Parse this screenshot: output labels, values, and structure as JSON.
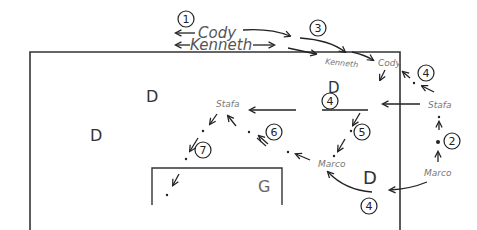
{
  "diagram": {
    "colors": {
      "ink": "#222222",
      "label": "#666666",
      "background": "#ffffff"
    },
    "players": {
      "cody_top": "Cody",
      "kenneth_top": "Kenneth",
      "kenneth_field": "Kenneth",
      "cody_field": "Cody",
      "stafa_right": "Stafa",
      "stafa_mid": "Stafa",
      "marco_right": "Marco",
      "marco_mid": "Marco"
    },
    "defenders": [
      "D",
      "D",
      "D",
      "D"
    ],
    "goalkeeper": "G",
    "steps": {
      "s1": "1",
      "s2": "2",
      "s3": "3",
      "s4a": "4",
      "s4b": "4",
      "s4c": "4",
      "s5": "5",
      "s6": "6",
      "s7": "7"
    }
  }
}
